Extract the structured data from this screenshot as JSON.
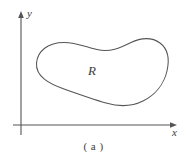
{
  "figure": {
    "caption": "( a )",
    "background_color": "#ffffff",
    "stroke_color": "#555555",
    "axes": {
      "x_label": "x",
      "y_label": "y",
      "origin": {
        "x": 21,
        "y": 125
      },
      "x_axis": {
        "start_x": 13,
        "end_x": 176,
        "y": 125,
        "arrow": "right"
      },
      "y_axis": {
        "x": 21,
        "start_y": 135,
        "end_y": 12,
        "arrow": "up"
      }
    },
    "region": {
      "label": "R",
      "label_position": {
        "x": 95,
        "y": 72
      },
      "shape": "closed-irregular-blob",
      "bounds": {
        "left": 34,
        "right": 168,
        "top": 39,
        "bottom": 106
      },
      "path": "M 36 62 C 38 48, 55 41, 75 44 C 88 46, 95 50, 108 50 C 122 50, 130 40, 144 39 C 158 38, 168 48, 167 64 C 166 80, 155 96, 140 102 C 126 108, 112 106, 98 102 C 82 97, 66 96, 52 90 C 40 85, 34 74, 36 62 Z"
    }
  }
}
